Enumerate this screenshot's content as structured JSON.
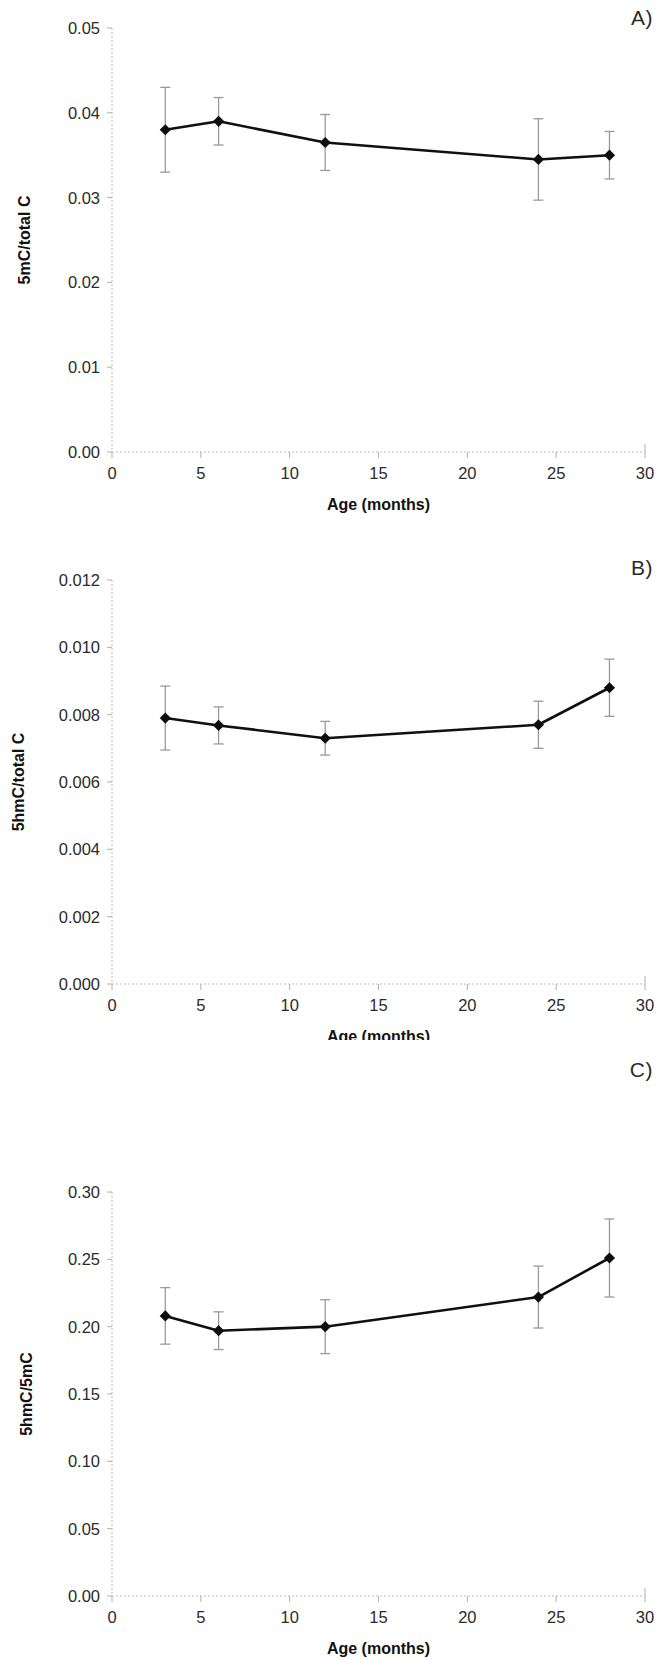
{
  "figure": {
    "panel_labels": [
      "A)",
      "B)",
      "C)"
    ],
    "shared_xlabel": "Age (months)",
    "x_tick_labels": [
      "0",
      "5",
      "10",
      "15",
      "20",
      "25",
      "30"
    ],
    "marker_color": "#0d0d0d",
    "line_color": "#101010",
    "errorbar_color": "#9a9a9a",
    "axis_color": "#b9b9b9"
  },
  "chart_data": [
    {
      "type": "line",
      "panel": "A)",
      "title": "",
      "xlabel": "Age (months)",
      "ylabel": "5mC/total C",
      "xlim": [
        0,
        30
      ],
      "ylim": [
        0.0,
        0.05
      ],
      "x_ticks": [
        0,
        5,
        10,
        15,
        20,
        25,
        30
      ],
      "x_tick_labels": [
        "0",
        "5",
        "10",
        "15",
        "20",
        "25",
        "30"
      ],
      "y_ticks": [
        0.0,
        0.01,
        0.02,
        0.03,
        0.04,
        0.05
      ],
      "y_tick_labels": [
        "0.00",
        "0.01",
        "0.02",
        "0.03",
        "0.04",
        "0.05"
      ],
      "grid": false,
      "legend": "none",
      "x": [
        3,
        6,
        12,
        24,
        28
      ],
      "values": [
        0.038,
        0.039,
        0.0365,
        0.0345,
        0.035
      ],
      "errors": [
        0.005,
        0.0028,
        0.0033,
        0.0048,
        0.0028
      ]
    },
    {
      "type": "line",
      "panel": "B)",
      "title": "",
      "xlabel": "Age (months)",
      "ylabel": "5hmC/total C",
      "xlim": [
        0,
        30
      ],
      "ylim": [
        0.0,
        0.012
      ],
      "x_ticks": [
        0,
        5,
        10,
        15,
        20,
        25,
        30
      ],
      "x_tick_labels": [
        "0",
        "5",
        "10",
        "15",
        "20",
        "25",
        "30"
      ],
      "y_ticks": [
        0.0,
        0.002,
        0.004,
        0.006,
        0.008,
        0.01,
        0.012
      ],
      "y_tick_labels": [
        "0.000",
        "0.002",
        "0.004",
        "0.006",
        "0.008",
        "0.010",
        "0.012"
      ],
      "grid": false,
      "legend": "none",
      "x": [
        3,
        6,
        12,
        24,
        28
      ],
      "values": [
        0.0079,
        0.00768,
        0.0073,
        0.0077,
        0.0088
      ],
      "errors": [
        0.00095,
        0.00055,
        0.0005,
        0.0007,
        0.00085
      ]
    },
    {
      "type": "line",
      "panel": "C)",
      "title": "",
      "xlabel": "Age (months)",
      "ylabel": "5hmC/5mC",
      "xlim": [
        0,
        30
      ],
      "ylim": [
        0.0,
        0.3
      ],
      "x_ticks": [
        0,
        5,
        10,
        15,
        20,
        25,
        30
      ],
      "x_tick_labels": [
        "0",
        "5",
        "10",
        "15",
        "20",
        "25",
        "30"
      ],
      "y_ticks": [
        0.0,
        0.05,
        0.1,
        0.15,
        0.2,
        0.25,
        0.3
      ],
      "y_tick_labels": [
        "0.00",
        "0.05",
        "0.10",
        "0.15",
        "0.20",
        "0.25",
        "0.30"
      ],
      "grid": false,
      "legend": "none",
      "x": [
        3,
        6,
        12,
        24,
        28
      ],
      "values": [
        0.208,
        0.197,
        0.2,
        0.222,
        0.251
      ],
      "errors": [
        0.021,
        0.014,
        0.02,
        0.023,
        0.029
      ]
    }
  ]
}
